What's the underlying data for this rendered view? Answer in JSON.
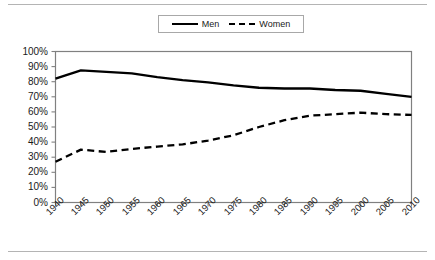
{
  "chart_data": {
    "type": "line",
    "title": "",
    "subtitle": "",
    "xlabel": "",
    "ylabel": "",
    "grid": false,
    "legend_position": "top-center",
    "xlim": [
      1940,
      2010
    ],
    "ylim": [
      0,
      100
    ],
    "x": [
      1940,
      1945,
      1950,
      1955,
      1960,
      1965,
      1970,
      1975,
      1980,
      1985,
      1990,
      1995,
      2000,
      2005,
      2010
    ],
    "categories": [
      "1940",
      "1945",
      "1950",
      "1955",
      "1960",
      "1965",
      "1970",
      "1975",
      "1980",
      "1985",
      "1990",
      "1995",
      "2000",
      "2005",
      "2010"
    ],
    "xtick_labels": [
      "1940",
      "1945",
      "1950",
      "1955",
      "1960",
      "1965",
      "1970",
      "1975",
      "1980",
      "1985",
      "1990",
      "1995",
      "2000",
      "2005",
      "2010"
    ],
    "ytick_labels": [
      "100%",
      "90%",
      "80%",
      "70%",
      "60%",
      "50%",
      "40%",
      "30%",
      "20%",
      "10%",
      "0%"
    ],
    "ytick_values": [
      100,
      90,
      80,
      70,
      60,
      50,
      40,
      30,
      20,
      10,
      0
    ],
    "series": [
      {
        "name": "Men",
        "style": "solid",
        "color": "#000000",
        "values": [
          82,
          87.5,
          86.5,
          85.5,
          83,
          81,
          79.5,
          77.5,
          76,
          75.5,
          75.5,
          74.5,
          74,
          72,
          70
        ]
      },
      {
        "name": "Women",
        "style": "dashed",
        "color": "#000000",
        "values": [
          27,
          35,
          33.5,
          35.5,
          37,
          38.5,
          41,
          44.5,
          50,
          54.5,
          57.5,
          58.5,
          59.5,
          58.5,
          58
        ]
      }
    ]
  },
  "legend": {
    "entries": [
      {
        "label": "Men",
        "style": "solid"
      },
      {
        "label": "Women",
        "style": "dashed"
      }
    ]
  },
  "colors": {
    "line": "#000000",
    "axis": "#808080",
    "rule": "#b4b4b4",
    "background": "#ffffff",
    "text": "#1a1a1a"
  }
}
